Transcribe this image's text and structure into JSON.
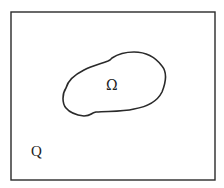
{
  "diagram": {
    "inner_region_label": "Ω",
    "outer_region_label": "Q",
    "stroke_color": "#2a2a2a",
    "background_color": "#ffffff"
  }
}
